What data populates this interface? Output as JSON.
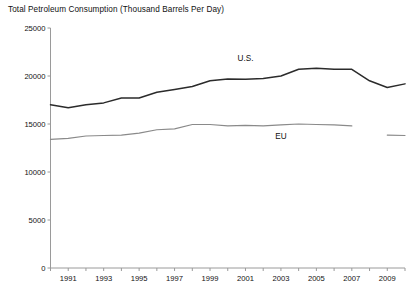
{
  "chart_data": {
    "type": "line",
    "title": "Total Petroleum Consumption (Thousand Barrels Per Day)",
    "xlabel": "",
    "ylabel": "",
    "ylim": [
      0,
      25000
    ],
    "xlim": [
      1990,
      2010
    ],
    "grid": false,
    "legend_position": "inline-annotations",
    "y_ticks": [
      0,
      5000,
      10000,
      15000,
      20000,
      25000
    ],
    "y_tick_labels": [
      "0",
      "5000",
      "10000",
      "15000",
      "20000",
      "25000"
    ],
    "x_ticks": [
      1990,
      1991,
      1992,
      1993,
      1994,
      1995,
      1996,
      1997,
      1998,
      1999,
      2000,
      2001,
      2002,
      2003,
      2004,
      2005,
      2006,
      2007,
      2008,
      2009,
      2010
    ],
    "x_tick_labels": [
      "",
      "1991",
      "",
      "1993",
      "",
      "1995",
      "",
      "1997",
      "",
      "1999",
      "",
      "2001",
      "",
      "2003",
      "",
      "2005",
      "",
      "2007",
      "",
      "2009",
      ""
    ],
    "annotations": [
      {
        "text": "U.S.",
        "x": 2001,
        "y": 21900
      },
      {
        "text": "EU",
        "x": 2003,
        "y": 13700
      }
    ],
    "series": [
      {
        "name": "U.S.",
        "color": "#2b2b2b",
        "width": 1.5,
        "x": [
          1990,
          1991,
          1992,
          1993,
          1994,
          1995,
          1996,
          1997,
          1998,
          1999,
          2000,
          2001,
          2002,
          2003,
          2004,
          2005,
          2006,
          2007,
          2008,
          2009,
          2010
        ],
        "values": [
          17000,
          16700,
          17000,
          17200,
          17700,
          17700,
          18300,
          18600,
          18900,
          19500,
          19700,
          19650,
          19750,
          20000,
          20700,
          20800,
          20700,
          20700,
          19500,
          18800,
          19180
        ]
      },
      {
        "name": "EU",
        "color": "#8a8a8a",
        "width": 1.2,
        "x": [
          1990,
          1991,
          1992,
          1993,
          1994,
          1995,
          1996,
          1997,
          1998,
          1999,
          2000,
          2001,
          2002,
          2003,
          2004,
          2005,
          2006,
          2007
        ],
        "values": [
          13400,
          13500,
          13750,
          13800,
          13850,
          14050,
          14400,
          14500,
          14950,
          14950,
          14800,
          14850,
          14800,
          14900,
          15000,
          14950,
          14900,
          14800
        ]
      },
      {
        "name": "EU-late",
        "color": "#8a8a8a",
        "width": 1.2,
        "x": [
          2009,
          2010
        ],
        "values": [
          13850,
          13800
        ]
      }
    ]
  }
}
